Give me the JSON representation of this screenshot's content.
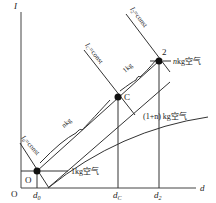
{
  "axes": {
    "y_label": "I",
    "x_label": "d",
    "origin_label": "O"
  },
  "points": {
    "zero": {
      "label": "O",
      "dot": true
    },
    "mix": {
      "label": "C",
      "dot": true
    },
    "two": {
      "label": "2",
      "dot": true
    }
  },
  "x_ticks": {
    "d0": "d",
    "d0_sub": "0",
    "dC": "d",
    "dC_sub": "C",
    "d2": "d",
    "d2_sub": "2"
  },
  "isolines": {
    "i0": {
      "main": "I",
      "sub": "0",
      "rest": "=const"
    },
    "iC": {
      "main": "I",
      "sub": "C",
      "rest": "=const"
    },
    "i2": {
      "main": "I",
      "sub": "2",
      "rest": "=const"
    }
  },
  "annotations": {
    "segment_nkg": "nkg",
    "segment_1kg": "1kg",
    "air_1kg": "1kg空气",
    "air_nkg_n": "n",
    "air_nkg_rest": "kg空气",
    "air_mix": "(1+n) kg空气",
    "air_mix_n": "n"
  }
}
